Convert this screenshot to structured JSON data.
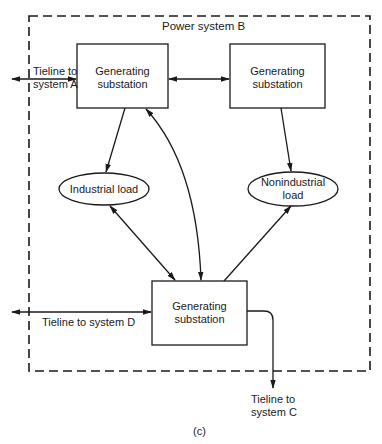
{
  "diagram": {
    "system_label": "Power system B",
    "caption": "(c)",
    "nodes": {
      "gen_top_left": {
        "line1": "Generating",
        "line2": "substation"
      },
      "gen_top_right": {
        "line1": "Generating",
        "line2": "substation"
      },
      "gen_bottom": {
        "line1": "Generating",
        "line2": "substation"
      },
      "industrial_load": {
        "label": "Industrial load"
      },
      "nonindustrial_load": {
        "line1": "Nonindustrial",
        "line2": "load"
      }
    },
    "tielines": {
      "system_a": {
        "line1": "Tieline to",
        "line2": "system A"
      },
      "system_d": {
        "label": "Tieline to system D"
      },
      "system_c": {
        "line1": "Tieline to",
        "line2": "system C"
      }
    },
    "edges": [
      {
        "from": "gen_top_left",
        "to": "gen_top_right",
        "direction": "bidirectional"
      },
      {
        "from": "gen_top_left",
        "to": "industrial_load",
        "direction": "forward"
      },
      {
        "from": "gen_top_right",
        "to": "nonindustrial_load",
        "direction": "forward"
      },
      {
        "from": "gen_top_left",
        "to": "gen_bottom",
        "direction": "bidirectional",
        "shape": "curve"
      },
      {
        "from": "industrial_load",
        "to": "gen_bottom",
        "direction": "bidirectional"
      },
      {
        "from": "gen_bottom",
        "to": "nonindustrial_load",
        "direction": "forward"
      },
      {
        "from": "gen_top_left",
        "to": "system_a",
        "direction": "bidirectional"
      },
      {
        "from": "gen_bottom",
        "to": "system_d",
        "direction": "bidirectional"
      },
      {
        "from": "gen_bottom",
        "to": "system_c",
        "direction": "forward"
      }
    ]
  }
}
